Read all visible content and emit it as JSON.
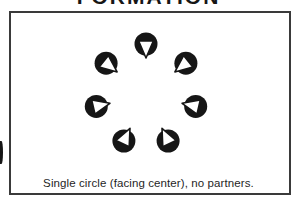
{
  "title": {
    "text": "FORMATION"
  },
  "caption": {
    "text": "Single circle (facing center), no partners."
  },
  "colors": {
    "ink": "#161616",
    "paper": "#ffffff",
    "frame_border": "#3a3a3a"
  },
  "formation": {
    "description": "Single circle of seven dancers, all facing the center, no partners",
    "facing": "center",
    "dancer_count": 7,
    "center": {
      "x": 146,
      "y": 95
    },
    "ring_radius": 51,
    "dancer_radius": 11.5,
    "dancers": [
      {
        "id": 1,
        "position": "top",
        "angle_deg": 90.0,
        "facing": "center"
      },
      {
        "id": 2,
        "position": "upper-left",
        "angle_deg": 141.4,
        "facing": "center"
      },
      {
        "id": 3,
        "position": "left",
        "angle_deg": 192.9,
        "facing": "center"
      },
      {
        "id": 4,
        "position": "bottom-left",
        "angle_deg": 244.3,
        "facing": "center"
      },
      {
        "id": 5,
        "position": "bottom-right",
        "angle_deg": 295.7,
        "facing": "center"
      },
      {
        "id": 6,
        "position": "right",
        "angle_deg": 347.1,
        "facing": "center"
      },
      {
        "id": 7,
        "position": "upper-right",
        "angle_deg": 38.6,
        "facing": "center"
      }
    ]
  }
}
